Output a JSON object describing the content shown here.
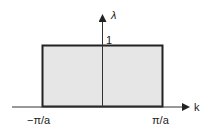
{
  "diagram": {
    "y_axis_label": "λ",
    "x_axis_label": "k",
    "height_label": "1",
    "left_label": "−π/a",
    "right_label": "π/a",
    "fill_color": "#e6e6e6",
    "stroke_color": "#222222"
  }
}
